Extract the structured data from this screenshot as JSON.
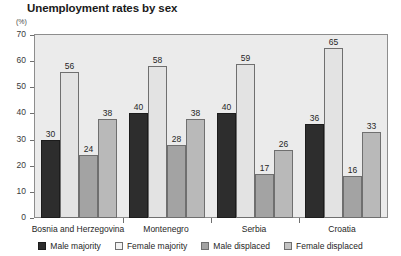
{
  "chart_data": {
    "type": "bar",
    "title": "Unemployment rates by sex",
    "xlabel": "",
    "ylabel": "(%)",
    "ylim": [
      0,
      70
    ],
    "yticks": [
      0,
      10,
      20,
      30,
      40,
      50,
      60,
      70
    ],
    "grid": false,
    "legend_position": "bottom",
    "categories": [
      "Bosnia and Herzegovina",
      "Montenegro",
      "Serbia",
      "Croatia"
    ],
    "series": [
      {
        "name": "Male majority",
        "color": "#2d2d2d",
        "values": [
          30,
          40,
          40,
          36
        ]
      },
      {
        "name": "Female majority",
        "color": "#e3e3e3",
        "values": [
          56,
          58,
          59,
          65
        ]
      },
      {
        "name": "Male displaced",
        "color": "#a3a3a3",
        "values": [
          24,
          28,
          17,
          16
        ]
      },
      {
        "name": "Female displaced",
        "color": "#b9b9b9",
        "values": [
          38,
          38,
          26,
          33
        ]
      }
    ]
  },
  "axis": {
    "unit_label": "(%)"
  }
}
